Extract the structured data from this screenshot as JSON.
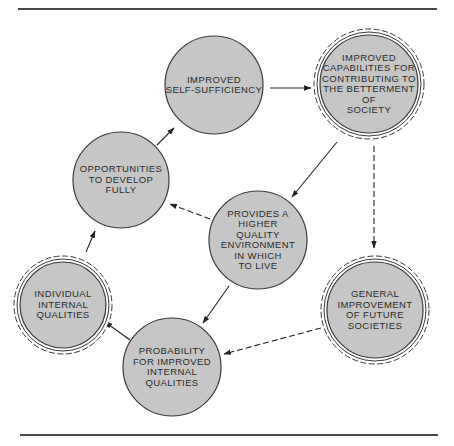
{
  "diagram": {
    "colors": {
      "fill": "#c6c6c6",
      "stroke": "#3a3a3a",
      "rule": "#4a4a4a",
      "background": "#ffffff"
    },
    "rules": [
      {
        "x1": 18,
        "y1": 9,
        "x2": 437,
        "y2": 9
      },
      {
        "x1": 20,
        "y1": 435,
        "x2": 438,
        "y2": 435
      }
    ],
    "nodes": [
      {
        "id": "self-sufficiency",
        "label": "IMPROVED\nSELF-SUFFICIENCY",
        "cx": 214,
        "cy": 85,
        "r": 49,
        "double_ring": false
      },
      {
        "id": "capabilities",
        "label": "IMPROVED\nCAPABILITIES FOR\nCONTRIBUTING TO\nTHE BETTERMENT OF\nSOCIETY",
        "cx": 369,
        "cy": 84,
        "r": 49,
        "double_ring": true
      },
      {
        "id": "opportunities",
        "label": "OPPORTUNITIES\nTO DEVELOP\nFULLY",
        "cx": 121,
        "cy": 180,
        "r": 48,
        "double_ring": false
      },
      {
        "id": "environment",
        "label": "PROVIDES A\nHIGHER\nQUALITY\nENVIRONMENT\nIN WHICH\nTO LIVE",
        "cx": 258,
        "cy": 240,
        "r": 49,
        "double_ring": false
      },
      {
        "id": "individual",
        "label": "INDIVIDUAL\nINTERNAL\nQUALITIES",
        "cx": 63,
        "cy": 305,
        "r": 43,
        "double_ring": true
      },
      {
        "id": "probability",
        "label": "PROBABILITY\nFOR IMPROVED\nINTERNAL\nQUALITIES",
        "cx": 172,
        "cy": 367,
        "r": 49,
        "double_ring": false
      },
      {
        "id": "future-societies",
        "label": "GENERAL\nIMPROVEMENT\nOF FUTURE\nSOCIETIES",
        "cx": 375,
        "cy": 310,
        "r": 48,
        "double_ring": true
      }
    ],
    "edges": [
      {
        "from": "self-sufficiency",
        "to": "capabilities",
        "style": "solid",
        "x1": 270,
        "y1": 88,
        "x2": 311,
        "y2": 88
      },
      {
        "from": "opportunities",
        "to": "self-sufficiency",
        "style": "solid",
        "x1": 157,
        "y1": 145,
        "x2": 174,
        "y2": 128
      },
      {
        "from": "capabilities",
        "to": "environment",
        "style": "solid",
        "x1": 337,
        "y1": 142,
        "x2": 292,
        "y2": 197
      },
      {
        "from": "capabilities",
        "to": "future-societies",
        "style": "dashed",
        "x1": 374,
        "y1": 146,
        "x2": 374,
        "y2": 248
      },
      {
        "from": "environment",
        "to": "opportunities",
        "style": "dashed",
        "x1": 210,
        "y1": 219,
        "x2": 170,
        "y2": 204
      },
      {
        "from": "environment",
        "to": "probability",
        "style": "solid",
        "x1": 229,
        "y1": 286,
        "x2": 203,
        "y2": 323
      },
      {
        "from": "individual",
        "to": "opportunities",
        "style": "solid",
        "x1": 86,
        "y1": 252,
        "x2": 95,
        "y2": 231
      },
      {
        "from": "probability",
        "to": "individual",
        "style": "solid",
        "x1": 130,
        "y1": 340,
        "x2": 105,
        "y2": 322
      },
      {
        "from": "future-societies",
        "to": "probability",
        "style": "dashed",
        "x1": 321,
        "y1": 328,
        "x2": 224,
        "y2": 354
      }
    ]
  }
}
